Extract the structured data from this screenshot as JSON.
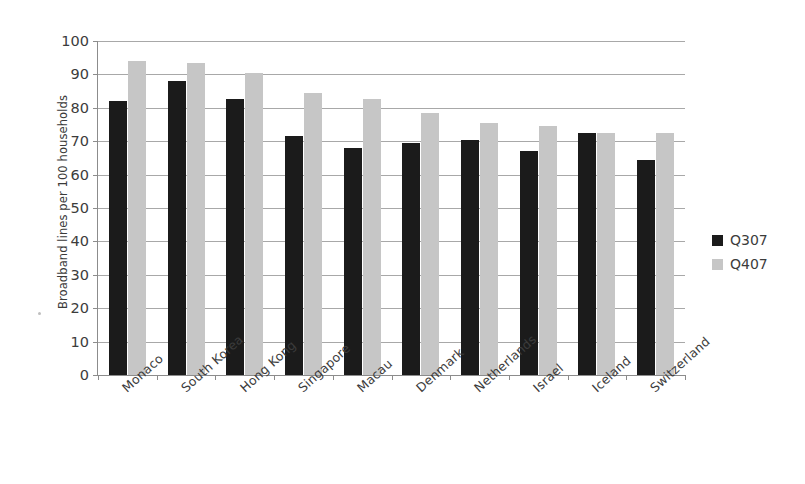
{
  "chart_data": {
    "type": "bar",
    "title": "",
    "subtitle": "",
    "xlabel": "",
    "ylabel": "Broadband lines per 100 households",
    "ylim": [
      0,
      100
    ],
    "ytick_step": 10,
    "yticks": [
      "100",
      "90",
      "80",
      "70",
      "60",
      "50",
      "40",
      "30",
      "20",
      "10",
      "0"
    ],
    "grid": true,
    "legend_position": "right",
    "categories": [
      "Monaco",
      "South Korea",
      "Hong Kong",
      "Singapore",
      "Macau",
      "Denmark",
      "Netherlands",
      "Israel",
      "Iceland",
      "Switzerland"
    ],
    "series": [
      {
        "name": "Q307",
        "color": "#1b1b1b",
        "values": [
          82,
          88,
          82.5,
          71.5,
          68,
          69.5,
          70.5,
          67,
          72.5,
          64.5
        ]
      },
      {
        "name": "Q407",
        "color": "#c6c6c6",
        "values": [
          94,
          93.5,
          90.5,
          84.5,
          82.5,
          78.5,
          75.5,
          74.5,
          72.5,
          72.5
        ]
      }
    ]
  },
  "legend": {
    "entries": [
      {
        "label": "Q307",
        "color": "#1b1b1b"
      },
      {
        "label": "Q407",
        "color": "#c6c6c6"
      }
    ]
  }
}
